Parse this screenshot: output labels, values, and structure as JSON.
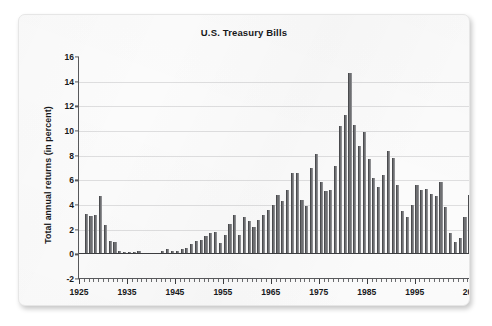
{
  "figure": {
    "title": "U.S. Treasury Bills",
    "x_axis_title": "Year-end",
    "y_axis_title": "Total annual returns (in percent)"
  },
  "chart_data": {
    "type": "bar",
    "title": "U.S. Treasury Bills",
    "xlabel": "Year-end",
    "ylabel": "Total annual returns (in percent)",
    "ylim": [
      -2,
      16
    ],
    "xlim": [
      1925,
      2008
    ],
    "ytick_labels": [
      "16",
      "14",
      "12",
      "10",
      "8",
      "6",
      "4",
      "2",
      "0",
      "-2"
    ],
    "yticks": [
      16,
      14,
      12,
      10,
      8,
      6,
      4,
      2,
      0,
      -2
    ],
    "xtick_labels": [
      "1925",
      "1935",
      "1945",
      "1955",
      "1965",
      "1975",
      "1985",
      "1995",
      "2007"
    ],
    "xticks": [
      1925,
      1935,
      1945,
      1955,
      1965,
      1975,
      1985,
      1995,
      2007
    ],
    "grid": "horizontal",
    "legend": "none",
    "bar_color": "#6f7073",
    "categories": [
      1926,
      1927,
      1928,
      1929,
      1930,
      1931,
      1932,
      1933,
      1934,
      1935,
      1936,
      1937,
      1938,
      1939,
      1940,
      1941,
      1942,
      1943,
      1944,
      1945,
      1946,
      1947,
      1948,
      1949,
      1950,
      1951,
      1952,
      1953,
      1954,
      1955,
      1956,
      1957,
      1958,
      1959,
      1960,
      1961,
      1962,
      1963,
      1964,
      1965,
      1966,
      1967,
      1968,
      1969,
      1970,
      1971,
      1972,
      1973,
      1974,
      1975,
      1976,
      1977,
      1978,
      1979,
      1980,
      1981,
      1982,
      1983,
      1984,
      1985,
      1986,
      1987,
      1988,
      1989,
      1990,
      1991,
      1992,
      1993,
      1994,
      1995,
      1996,
      1997,
      1998,
      1999,
      2000,
      2001,
      2002,
      2003,
      2004,
      2005,
      2006,
      2007
    ],
    "values": [
      3.3,
      3.1,
      3.2,
      4.7,
      2.4,
      1.1,
      1.0,
      0.3,
      0.2,
      0.2,
      0.2,
      0.3,
      0.0,
      0.0,
      0.0,
      0.1,
      0.3,
      0.4,
      0.3,
      0.3,
      0.4,
      0.5,
      0.8,
      1.1,
      1.2,
      1.5,
      1.7,
      1.8,
      0.9,
      1.6,
      2.5,
      3.2,
      1.6,
      3.0,
      2.7,
      2.2,
      2.8,
      3.2,
      3.6,
      4.0,
      4.8,
      4.3,
      5.2,
      6.6,
      6.6,
      4.4,
      3.9,
      7.0,
      8.1,
      5.9,
      5.1,
      5.2,
      7.2,
      10.4,
      11.3,
      14.7,
      10.5,
      8.8,
      9.9,
      7.7,
      6.2,
      5.5,
      6.4,
      8.4,
      7.8,
      5.6,
      3.5,
      3.0,
      4.0,
      5.6,
      5.2,
      5.3,
      4.9,
      4.7,
      5.9,
      3.8,
      1.7,
      1.0,
      1.3,
      3.0,
      4.8,
      4.7
    ]
  }
}
